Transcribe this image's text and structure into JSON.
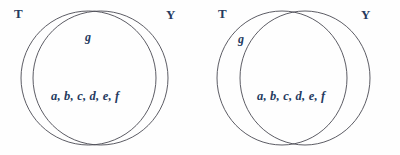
{
  "figure": {
    "type": "venn-diagram-pair",
    "background_color": "#fefefe",
    "stroke_color": "#4a4a52",
    "text_color": "#253a5e",
    "diagrams": [
      {
        "name": "left-venn",
        "sets": [
          {
            "key": "T",
            "label": "T",
            "label_x": 14,
            "label_y": 7
          },
          {
            "key": "Y",
            "label": "Y",
            "label_x": 166,
            "label_y": 8
          }
        ],
        "regions": [
          {
            "name": "intersection-upper",
            "label": "g",
            "label_x": 85,
            "label_y": 31
          },
          {
            "name": "intersection-lower",
            "label": "a, b, c, d, e, f",
            "label_x": 51,
            "label_y": 90
          }
        ]
      },
      {
        "name": "right-venn",
        "sets": [
          {
            "key": "T",
            "label": "T",
            "label_x": 18,
            "label_y": 7
          },
          {
            "key": "Y",
            "label": "Y",
            "label_x": 161,
            "label_y": 8
          }
        ],
        "regions": [
          {
            "name": "t-only-lune",
            "label": "g",
            "label_x": 38,
            "label_y": 33
          },
          {
            "name": "intersection-lower",
            "label": "a, b, c, d, e, f",
            "label_x": 57,
            "label_y": 90
          }
        ]
      }
    ]
  }
}
